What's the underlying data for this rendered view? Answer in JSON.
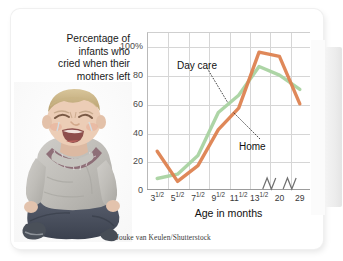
{
  "figure": {
    "headline_lines": [
      "Percentage of",
      "infants who",
      "cried when their",
      "mothers left"
    ],
    "credit": "Jouke van Keulen/Shutterstock",
    "photo_alt": "crying-toddler-photo"
  },
  "colors": {
    "home_line": "#dd8250",
    "day_care_line": "#a9d3a1",
    "gridline": "#d6d6d6",
    "axis": "#9c9c9c",
    "text": "#1a1a1a"
  },
  "chart_data": {
    "type": "line",
    "title": "Percentage of infants who cried when their mothers left",
    "xlabel": "Age in months",
    "ylabel": "",
    "ylim": [
      0,
      110
    ],
    "yticks": [
      0,
      20,
      40,
      60,
      80,
      100
    ],
    "ytick_labels": [
      "0",
      "20",
      "40",
      "60",
      "80",
      "100%"
    ],
    "categories": [
      "3½",
      "5½",
      "7½",
      "9½",
      "11½",
      "13½",
      "20",
      "29"
    ],
    "category_labels": [
      {
        "whole": "3",
        "frac": "1/2"
      },
      {
        "whole": "5",
        "frac": "1/2"
      },
      {
        "whole": "7",
        "frac": "1/2"
      },
      {
        "whole": "9",
        "frac": "1/2"
      },
      {
        "whole": "11",
        "frac": "1/2"
      },
      {
        "whole": "13",
        "frac": "1/2"
      },
      {
        "whole": "20",
        "frac": ""
      },
      {
        "whole": "29",
        "frac": ""
      }
    ],
    "grid": true,
    "legend": "inline-annotations",
    "axis_break": true,
    "series": [
      {
        "name": "Day care",
        "color": "#a9d3a1",
        "values": [
          8,
          11,
          24,
          54,
          66,
          86,
          80,
          70
        ]
      },
      {
        "name": "Home",
        "color": "#dd8250",
        "values": [
          27,
          6,
          17,
          42,
          57,
          96,
          93,
          60
        ]
      }
    ],
    "annotations": [
      {
        "label": "Day care",
        "series": "Day care"
      },
      {
        "label": "Home",
        "series": "Home"
      }
    ]
  }
}
